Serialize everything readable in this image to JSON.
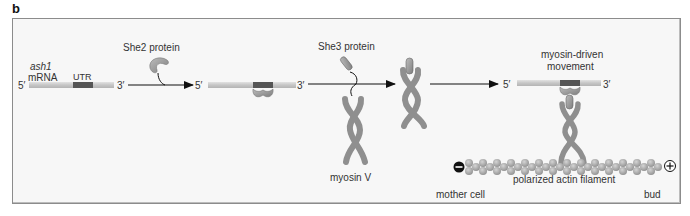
{
  "figure": {
    "panel_label": "b",
    "step1": {
      "gene_label": "ash1",
      "molecule_label": "mRNA",
      "utr_label": "UTR",
      "five_prime": "5′",
      "three_prime": "3′"
    },
    "step2": {
      "protein_label": "She2 protein",
      "five_prime": "5′",
      "three_prime": "3′"
    },
    "step3": {
      "protein_label": "She3 protein",
      "motor_label": "myosin V"
    },
    "step4": {
      "title_line1": "myosin-driven",
      "title_line2": "movement",
      "five_prime": "5′",
      "three_prime": "3′",
      "filament_label": "polarized actin filament",
      "minus_end": "−",
      "plus_end": "+",
      "left_region": "mother cell",
      "right_region": "bud"
    },
    "colors": {
      "background": "#f7f7f7",
      "border": "#8c8c8c",
      "mrna": "#c8c8c8",
      "utr": "#555555",
      "protein": "#9a9a9a",
      "arrow": "#111111",
      "actin": "#a9a9a9"
    }
  }
}
